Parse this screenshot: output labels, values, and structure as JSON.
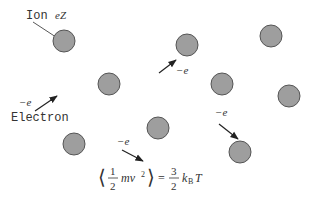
{
  "colors": {
    "ion_fill": "#9e9e9e",
    "ion_stroke": "#555555",
    "ink": "#333333",
    "background": "#ffffff"
  },
  "labels": {
    "ion": "Ion",
    "ion_charge": "eZ",
    "electron": "Electron",
    "electron_charge": "−e"
  },
  "ions": [
    {
      "cx": 64,
      "cy": 41,
      "r": 11
    },
    {
      "cx": 187,
      "cy": 45,
      "r": 11
    },
    {
      "cx": 271,
      "cy": 36,
      "r": 11
    },
    {
      "cx": 109,
      "cy": 84,
      "r": 11
    },
    {
      "cx": 222,
      "cy": 84,
      "r": 11
    },
    {
      "cx": 289,
      "cy": 96,
      "r": 11
    },
    {
      "cx": 158,
      "cy": 128,
      "r": 11
    },
    {
      "cx": 74,
      "cy": 144,
      "r": 11
    },
    {
      "cx": 240,
      "cy": 152,
      "r": 11
    }
  ],
  "electrons": [
    {
      "x1": 35,
      "y1": 111,
      "x2": 57,
      "y2": 96,
      "label": "−e",
      "lx": 19,
      "ly": 106
    },
    {
      "x1": 159,
      "y1": 73,
      "x2": 176,
      "y2": 60,
      "label": "−e",
      "lx": 176,
      "ly": 74
    },
    {
      "x1": 122,
      "y1": 150,
      "x2": 143,
      "y2": 161,
      "label": "−e",
      "lx": 117,
      "ly": 145
    },
    {
      "x1": 219,
      "y1": 124,
      "x2": 238,
      "y2": 139,
      "label": "−e",
      "lx": 215,
      "ly": 116
    }
  ],
  "formula": {
    "lhs_frac_num": "1",
    "lhs_frac_den": "2",
    "lhs_body": "mv⃗",
    "lhs_exp": "2",
    "equals": "=",
    "rhs_frac_num": "3",
    "rhs_frac_den": "2",
    "rhs_k": "k",
    "rhs_sub": "B",
    "rhs_T": "T"
  }
}
